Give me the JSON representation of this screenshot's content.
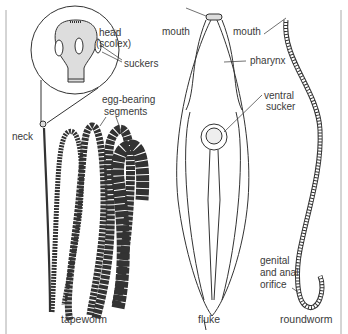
{
  "diagram": {
    "panels": [
      {
        "caption": "tapeworm",
        "labels": {
          "head": "head",
          "scolex": "(scolex)",
          "suckers": "suckers",
          "egg_bearing_1": "egg-bearing",
          "egg_bearing_2": "segments",
          "neck": "neck"
        }
      },
      {
        "caption": "fluke",
        "labels": {
          "mouth": "mouth",
          "pharynx": "pharynx",
          "ventral_1": "ventral",
          "ventral_2": "sucker"
        }
      },
      {
        "caption": "roundworm",
        "labels": {
          "mouth": "mouth",
          "orifice_1": "genital",
          "orifice_2": "and anal",
          "orifice_3": "orifice"
        }
      }
    ],
    "colors": {
      "line": "#333333",
      "segment_fill": "#e2e2e2",
      "stipple": "#888888",
      "frame": "#999999"
    }
  }
}
